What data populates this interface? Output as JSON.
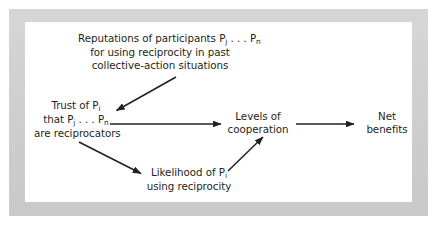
{
  "figure": {
    "background_color": "#ffffff",
    "frame_color": "#d2d2d2",
    "canvas_color": "#ffffff",
    "text_color": "#231f20",
    "arrow_color": "#231f20"
  },
  "nodes": {
    "reputations": {
      "line1_a": "Reputations of participants P",
      "line1_sub1": "j",
      "line1_b": " . . . P",
      "line1_sub2": "n",
      "line2": "for using reciprocity in past",
      "line3": "collective-action situations"
    },
    "trust": {
      "line1_a": "Trust of P",
      "line1_sub": "i",
      "line2_a": "that P",
      "line2_sub1": "j",
      "line2_b": " . . . P",
      "line2_sub2": "n",
      "line3": "are reciprocators"
    },
    "cooperation": {
      "line1": "Levels of",
      "line2": "cooperation"
    },
    "benefits": {
      "line1": "Net",
      "line2": "benefits"
    },
    "likelihood": {
      "line1_a": "Likelihood of P",
      "line1_sub": "i",
      "line2": "using reciprocity"
    }
  },
  "edges": [
    {
      "name": "reputations-to-trust",
      "from": "reputations",
      "to": "trust"
    },
    {
      "name": "trust-to-cooperation",
      "from": "trust",
      "to": "cooperation"
    },
    {
      "name": "trust-to-likelihood",
      "from": "trust",
      "to": "likelihood"
    },
    {
      "name": "likelihood-to-cooperation",
      "from": "likelihood",
      "to": "cooperation"
    },
    {
      "name": "cooperation-to-benefits",
      "from": "cooperation",
      "to": "benefits"
    }
  ]
}
